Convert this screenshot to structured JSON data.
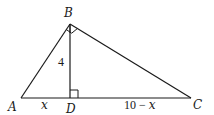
{
  "diagram": {
    "type": "right-triangle-with-altitude",
    "points": {
      "A": {
        "label": "A",
        "x": 21,
        "y": 98
      },
      "B": {
        "label": "B",
        "x": 70,
        "y": 24
      },
      "C": {
        "label": "C",
        "x": 191,
        "y": 98
      },
      "D": {
        "label": "D",
        "x": 70,
        "y": 98
      }
    },
    "segments": [
      {
        "from": "A",
        "to": "B"
      },
      {
        "from": "B",
        "to": "C"
      },
      {
        "from": "A",
        "to": "C"
      },
      {
        "from": "B",
        "to": "D"
      }
    ],
    "right_angles": [
      "B",
      "D"
    ],
    "measures": {
      "BD": "4",
      "AD": "x",
      "DC_num": "10 − ",
      "DC_var": "x"
    },
    "stroke_color": "#1a1a1a"
  }
}
